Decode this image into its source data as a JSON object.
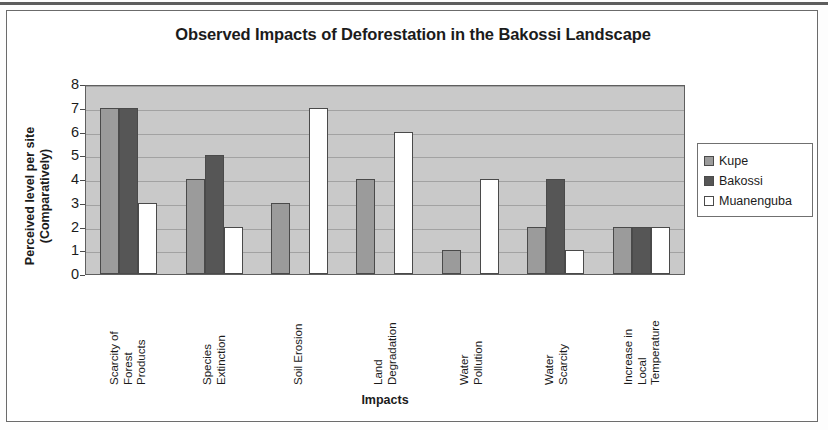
{
  "chart_data": {
    "type": "bar",
    "title": "Observed Impacts of Deforestation in the Bakossi Landscape",
    "xlabel": "Impacts",
    "ylabel": "Perceived level per site (Comparatively)",
    "ylim": [
      0,
      8
    ],
    "yticks": [
      8,
      7,
      6,
      5,
      4,
      3,
      2,
      1,
      0
    ],
    "grid": true,
    "legend_position": "right",
    "categories": [
      "Scarcity of Forest Products",
      "Species Extinction",
      "Soil Erosion",
      "Land Degradation",
      "Water Pollution",
      "Water Scarcity",
      "Increase in Local Temperature"
    ],
    "category_lines": [
      [
        "Scarcity of",
        "Forest",
        "Products"
      ],
      [
        "Species",
        "Extinction"
      ],
      [
        "Soil Erosion"
      ],
      [
        "Land",
        "Degradation"
      ],
      [
        "Water",
        "Pollution"
      ],
      [
        "Water",
        "Scarcity"
      ],
      [
        "Increase in",
        "Local",
        "Temperature"
      ]
    ],
    "series": [
      {
        "name": "Kupe",
        "color": "#9b9b9b",
        "values": [
          7,
          4,
          3,
          4,
          1,
          2,
          2
        ]
      },
      {
        "name": "Bakossi",
        "color": "#565656",
        "values": [
          7,
          5,
          0,
          0,
          0,
          4,
          2
        ]
      },
      {
        "name": "Muanenguba",
        "color": "#ffffff",
        "values": [
          3,
          2,
          7,
          6,
          4,
          1,
          2
        ]
      }
    ]
  },
  "legend": {
    "items": [
      {
        "label": "Kupe"
      },
      {
        "label": "Bakossi"
      },
      {
        "label": "Muanenguba"
      }
    ]
  }
}
